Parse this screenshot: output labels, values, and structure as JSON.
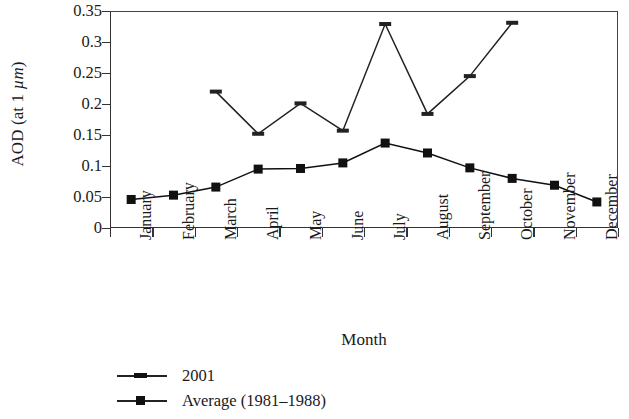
{
  "chart_data": {
    "type": "line",
    "title": "",
    "xlabel": "Month",
    "ylabel": "AOD (at 1 µm)",
    "ylabel_parts": {
      "prefix": "AOD (at 1 ",
      "mu": "µm",
      "suffix": ")"
    },
    "categories": [
      "January",
      "February",
      "March",
      "April",
      "May",
      "June",
      "July",
      "August",
      "September",
      "October",
      "November",
      "December"
    ],
    "ylim": [
      0,
      0.35
    ],
    "yticks": [
      0,
      0.05,
      0.1,
      0.15,
      0.2,
      0.25,
      0.3,
      0.35
    ],
    "ytick_labels": [
      "0",
      "0.05",
      "0.1",
      "0.15",
      "0.2",
      "0.25",
      "0.3",
      "0.35"
    ],
    "grid": false,
    "legend_position": "below-plot-left",
    "series": [
      {
        "name": "2001",
        "marker": "dash",
        "color": "#222222",
        "values": [
          null,
          null,
          0.22,
          0.152,
          0.201,
          0.157,
          0.329,
          0.184,
          0.245,
          0.331,
          null,
          null
        ]
      },
      {
        "name": "Average (1981–1988)",
        "marker": "square",
        "color": "#111111",
        "values": [
          0.046,
          0.053,
          0.066,
          0.095,
          0.096,
          0.105,
          0.137,
          0.121,
          0.097,
          0.08,
          0.069,
          0.042
        ]
      }
    ]
  },
  "legend": {
    "items": [
      {
        "label": "2001"
      },
      {
        "label": "Average (1981–1988)"
      }
    ]
  }
}
